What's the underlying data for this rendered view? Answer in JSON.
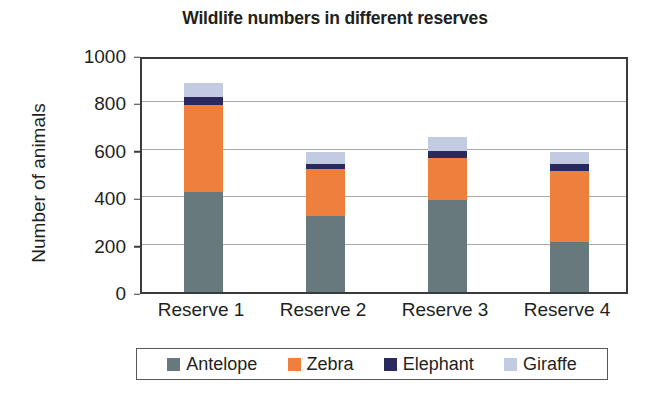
{
  "chart_data": {
    "type": "bar",
    "subtype": "stacked-bar",
    "title": "Wildlife numbers in different reserves",
    "xlabel": "",
    "ylabel": "Number of animals",
    "categories": [
      "Reserve 1",
      "Reserve 2",
      "Reserve 3",
      "Reserve 4"
    ],
    "series": [
      {
        "name": "Antelope",
        "color": "#67797d",
        "values": [
          420,
          320,
          390,
          210
        ]
      },
      {
        "name": "Zebra",
        "color": "#ef7f3d",
        "values": [
          370,
          200,
          175,
          300
        ]
      },
      {
        "name": "Elephant",
        "color": "#2a2a5e",
        "values": [
          35,
          20,
          30,
          30
        ]
      },
      {
        "name": "Giraffe",
        "color": "#c3cbe2",
        "values": [
          55,
          50,
          60,
          50
        ]
      }
    ],
    "totals": [
      880,
      590,
      655,
      590
    ],
    "ylim": [
      0,
      1000
    ],
    "yticks": [
      0,
      200,
      400,
      600,
      800,
      1000
    ],
    "ytick_labels": [
      "0",
      "200",
      "400",
      "600",
      "800",
      "1000"
    ],
    "grid": true,
    "grid_axis": "y",
    "legend_position": "bottom",
    "legend_entries": [
      "Antelope",
      "Zebra",
      "Elephant",
      "Giraffe"
    ],
    "colors": {
      "antelope": "#67797d",
      "zebra": "#ef7f3d",
      "elephant": "#2a2a5e",
      "giraffe": "#c3cbe2",
      "axis": "#3b3b3b",
      "gridline": "#a9a9a9",
      "text": "#231f20",
      "background": "#ffffff"
    }
  }
}
